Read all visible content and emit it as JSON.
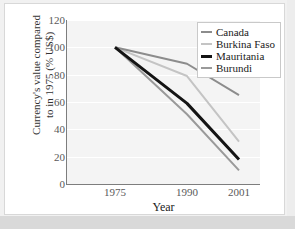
{
  "chart_data": {
    "type": "line",
    "title": "",
    "xlabel": "Year",
    "ylabel": "Currency's value compared to in 1975 (% US$)",
    "ylabel_line1": "Currency's value compared",
    "ylabel_line2": "to in 1975 (% US$)",
    "x": [
      "1975",
      "1990",
      "2001"
    ],
    "categories": [
      "1975",
      "1990",
      "2001"
    ],
    "xtick_labels": [
      "1975",
      "1990",
      "2001"
    ],
    "ytick_labels": [
      "0",
      "20",
      "40",
      "60",
      "80",
      "100",
      "120"
    ],
    "ytick_values": [
      0,
      20,
      40,
      60,
      80,
      100,
      120
    ],
    "ylim": [
      0,
      120
    ],
    "grid": "horizontal",
    "legend_position": "top-right",
    "series": [
      {
        "name": "Canada",
        "values": [
          100,
          88,
          65
        ],
        "color": "#8c8c8c",
        "width": 2
      },
      {
        "name": "Burkina Faso",
        "values": [
          100,
          79,
          31
        ],
        "color": "#c4c4c4",
        "width": 2
      },
      {
        "name": "Mauritania",
        "values": [
          100,
          59,
          18
        ],
        "color": "#141414",
        "width": 3
      },
      {
        "name": "Burundi",
        "values": [
          100,
          51,
          10
        ],
        "color": "#9a9a9a",
        "width": 2
      }
    ]
  },
  "legend": {
    "items": [
      {
        "label": "Canada"
      },
      {
        "label": "Burkina Faso"
      },
      {
        "label": "Mauritania"
      },
      {
        "label": "Burundi"
      }
    ]
  },
  "axes": {
    "y_title_line1": "Currency's value compared",
    "y_title_line2": "to in 1975 (% US$)",
    "x_title": "Year"
  },
  "colors": {
    "panel_background": "#f4f4f4",
    "figure_background": "#ffffff",
    "gridline": "#ffffff",
    "axis": "#7d7d7d",
    "tick_text": "#595959"
  }
}
